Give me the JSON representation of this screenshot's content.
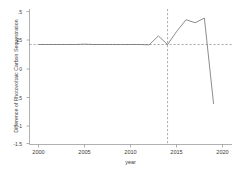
{
  "chart_data": {
    "type": "line",
    "title": "",
    "xlabel": "year",
    "ylabel": "Difference of Photovoltaic Carbon Sequestration",
    "xlim": [
      1999,
      2021
    ],
    "ylim": [
      -1.5,
      0.5
    ],
    "xticks": [
      2000,
      2005,
      2010,
      2015,
      2020
    ],
    "xtick_labels": [
      "2000",
      "2005",
      "2010",
      "2015",
      "2020"
    ],
    "yticks": [
      0.5,
      0.25,
      0,
      -0.5,
      -1,
      -1.5
    ],
    "ytick_labels": [
      ".5",
      ".25",
      "0",
      "-.5",
      "-1",
      "-1.5"
    ],
    "grid": false,
    "line_color": "#6f6f6f",
    "reference_line_color": "#8a8a8a",
    "zero_line": {
      "value": 0,
      "style": "dashed",
      "orientation": "horizontal"
    },
    "event_line": {
      "value": 2014,
      "label": "2014",
      "style": "dashed",
      "orientation": "vertical"
    },
    "x": [
      2000,
      2001,
      2002,
      2003,
      2004,
      2005,
      2006,
      2007,
      2008,
      2009,
      2010,
      2011,
      2012,
      2013,
      2014,
      2015,
      2016,
      2017,
      2018,
      2019
    ],
    "values": [
      0.0,
      0.0,
      0.0,
      0.0,
      0.0,
      0.005,
      0.0,
      0.0,
      0.0,
      0.0,
      0.0,
      0.0,
      -0.005,
      0.13,
      0.0,
      0.2,
      0.375,
      0.33,
      0.4,
      -0.9
    ],
    "series": [
      {
        "name": "Difference of Photovoltaic Carbon Sequestration",
        "values": [
          0.0,
          0.0,
          0.0,
          0.0,
          0.0,
          0.005,
          0.0,
          0.0,
          0.0,
          0.0,
          0.0,
          0.0,
          -0.005,
          0.13,
          0.0,
          0.2,
          0.375,
          0.33,
          0.4,
          -0.9
        ]
      }
    ]
  },
  "axes": {
    "x_title": "year",
    "y_title": "Difference of Photovoltaic Carbon Sequestration"
  },
  "xticks": {
    "t0": "2000",
    "t1": "2005",
    "t2": "2010",
    "t3": "2015",
    "t4": "2020"
  },
  "yticks": {
    "t0": ".5",
    "t1": ".25",
    "t2": "0",
    "t3": "-.5",
    "t4": "-1",
    "t5": "-1.5"
  }
}
